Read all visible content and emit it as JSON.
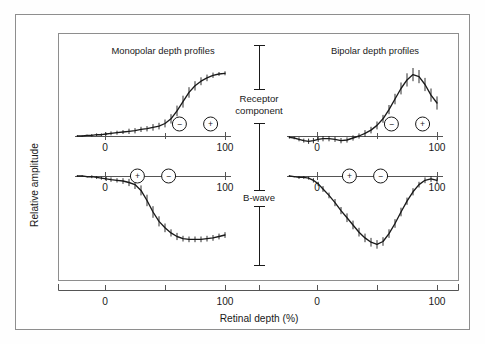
{
  "figure": {
    "y_axis_label": "Relative amplitude",
    "x_axis_label": "Retinal depth (%)",
    "bracket_labels": {
      "receptor": "Receptor component",
      "receptor_line1": "Receptor",
      "receptor_line2": "component",
      "bwave": "B-wave"
    },
    "colors": {
      "frame": "#8e8e8e",
      "axis": "#555555",
      "curve": "#1a1a1a",
      "text": "#1a1a1a",
      "background": "#ffffff"
    }
  },
  "panels": [
    {
      "id": "monopolar-receptor",
      "title": "Monopolar depth profiles",
      "row": "receptor-component",
      "column": "monopolar",
      "polarity_markers": [
        {
          "sign": "−",
          "x": 62
        },
        {
          "sign": "+",
          "x": 88
        }
      ],
      "axis_ticks": [
        0,
        100
      ],
      "axis_tick_labels": [
        "0",
        "100"
      ]
    },
    {
      "id": "bipolar-receptor",
      "title": "Bipolar depth profiles",
      "row": "receptor-component",
      "column": "bipolar",
      "polarity_markers": [
        {
          "sign": "−",
          "x": 62
        },
        {
          "sign": "+",
          "x": 88
        }
      ],
      "axis_ticks": [
        0,
        100
      ],
      "axis_tick_labels": [
        "0",
        "100"
      ]
    },
    {
      "id": "monopolar-bwave",
      "title": "",
      "row": "b-wave",
      "column": "monopolar",
      "polarity_markers": [
        {
          "sign": "+",
          "x": 27
        },
        {
          "sign": "−",
          "x": 53
        }
      ],
      "axis_ticks": [
        0,
        100
      ],
      "axis_tick_labels": [
        "0",
        "100"
      ]
    },
    {
      "id": "bipolar-bwave",
      "title": "",
      "row": "b-wave",
      "column": "bipolar",
      "polarity_markers": [
        {
          "sign": "+",
          "x": 27
        },
        {
          "sign": "−",
          "x": 53
        }
      ],
      "axis_ticks": [
        0,
        100
      ],
      "axis_tick_labels": [
        "0",
        "100"
      ]
    }
  ],
  "bottom_axis": {
    "tick_labels": [
      "0",
      "100",
      "0",
      "100"
    ],
    "label": "Retinal depth (%)"
  },
  "chart_data": {
    "type": "line",
    "xlabel": "Retinal depth (%)",
    "ylabel": "Relative amplitude",
    "xlim": [
      -25,
      105
    ],
    "ylim": [
      -1.1,
      1.1
    ],
    "grid": false,
    "legend": null,
    "error_bars": "vertical standard-error ticks at each data point",
    "series": [
      {
        "name": "Monopolar depth profile – receptor component",
        "panel": "monopolar-receptor",
        "x": [
          -23,
          -19,
          -15,
          -11,
          -7,
          -3,
          1,
          5,
          10,
          15,
          20,
          25,
          30,
          35,
          40,
          45,
          50,
          55,
          60,
          65,
          70,
          75,
          80,
          85,
          90,
          95,
          100
        ],
        "y": [
          0.0,
          0.0,
          0.01,
          0.01,
          0.02,
          0.02,
          0.03,
          0.04,
          0.05,
          0.06,
          0.07,
          0.08,
          0.1,
          0.11,
          0.13,
          0.15,
          0.19,
          0.26,
          0.38,
          0.52,
          0.66,
          0.76,
          0.83,
          0.88,
          0.92,
          0.94,
          0.95
        ],
        "err": [
          0.01,
          0.01,
          0.01,
          0.02,
          0.02,
          0.02,
          0.02,
          0.03,
          0.03,
          0.03,
          0.04,
          0.04,
          0.04,
          0.04,
          0.05,
          0.05,
          0.06,
          0.07,
          0.08,
          0.09,
          0.08,
          0.07,
          0.06,
          0.05,
          0.04,
          0.03,
          0.03
        ]
      },
      {
        "name": "Bipolar depth profile – receptor component",
        "panel": "bipolar-receptor",
        "x": [
          -23,
          -19,
          -15,
          -11,
          -7,
          -3,
          1,
          5,
          10,
          15,
          20,
          25,
          30,
          35,
          40,
          45,
          50,
          55,
          60,
          65,
          70,
          75,
          80,
          85,
          90,
          95,
          100
        ],
        "y": [
          -0.02,
          -0.03,
          -0.05,
          -0.07,
          -0.08,
          -0.07,
          -0.05,
          -0.04,
          -0.04,
          -0.05,
          -0.07,
          -0.06,
          -0.03,
          0.0,
          0.04,
          0.09,
          0.16,
          0.26,
          0.4,
          0.56,
          0.72,
          0.85,
          0.93,
          0.9,
          0.78,
          0.62,
          0.5
        ],
        "err": [
          0.02,
          0.02,
          0.03,
          0.03,
          0.04,
          0.04,
          0.04,
          0.04,
          0.04,
          0.04,
          0.04,
          0.04,
          0.04,
          0.04,
          0.05,
          0.05,
          0.06,
          0.06,
          0.07,
          0.08,
          0.09,
          0.1,
          0.1,
          0.1,
          0.1,
          0.1,
          0.1
        ]
      },
      {
        "name": "Monopolar depth profile – B-wave",
        "panel": "monopolar-bwave",
        "x": [
          -23,
          -19,
          -15,
          -11,
          -7,
          -3,
          1,
          5,
          10,
          15,
          20,
          25,
          30,
          35,
          40,
          45,
          50,
          55,
          60,
          65,
          70,
          75,
          80,
          85,
          90,
          95,
          100
        ],
        "y": [
          0.0,
          0.0,
          -0.01,
          -0.01,
          -0.02,
          -0.03,
          -0.04,
          -0.05,
          -0.06,
          -0.07,
          -0.09,
          -0.12,
          -0.2,
          -0.34,
          -0.5,
          -0.63,
          -0.72,
          -0.79,
          -0.84,
          -0.87,
          -0.88,
          -0.88,
          -0.88,
          -0.87,
          -0.86,
          -0.84,
          -0.82
        ],
        "err": [
          0.01,
          0.01,
          0.01,
          0.02,
          0.02,
          0.02,
          0.03,
          0.03,
          0.03,
          0.04,
          0.05,
          0.06,
          0.07,
          0.08,
          0.08,
          0.07,
          0.06,
          0.05,
          0.05,
          0.04,
          0.04,
          0.04,
          0.04,
          0.04,
          0.04,
          0.04,
          0.04
        ]
      },
      {
        "name": "Bipolar depth profile – B-wave",
        "panel": "bipolar-bwave",
        "x": [
          -23,
          -19,
          -15,
          -11,
          -7,
          -3,
          1,
          5,
          10,
          15,
          20,
          25,
          30,
          35,
          40,
          45,
          50,
          55,
          60,
          65,
          70,
          75,
          80,
          85,
          90,
          95,
          100
        ],
        "y": [
          0.0,
          -0.01,
          -0.02,
          -0.02,
          -0.03,
          -0.06,
          -0.11,
          -0.18,
          -0.27,
          -0.37,
          -0.48,
          -0.58,
          -0.68,
          -0.78,
          -0.86,
          -0.92,
          -0.95,
          -0.91,
          -0.8,
          -0.66,
          -0.5,
          -0.35,
          -0.22,
          -0.12,
          -0.06,
          -0.04,
          -0.06
        ],
        "err": [
          0.01,
          0.01,
          0.02,
          0.02,
          0.02,
          0.03,
          0.03,
          0.04,
          0.04,
          0.05,
          0.05,
          0.06,
          0.06,
          0.06,
          0.06,
          0.06,
          0.06,
          0.06,
          0.06,
          0.06,
          0.06,
          0.05,
          0.05,
          0.04,
          0.04,
          0.04,
          0.04
        ]
      }
    ]
  }
}
